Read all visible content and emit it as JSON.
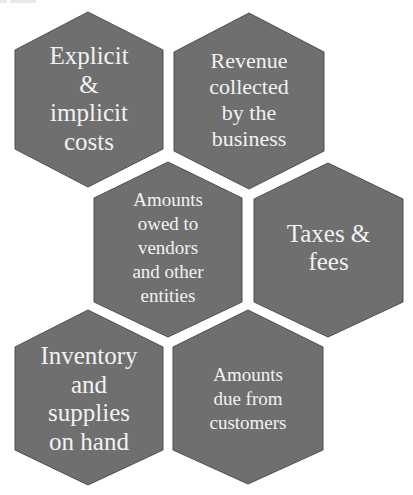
{
  "diagram": {
    "type": "hexagon-cluster",
    "fill_color": "#6f6f6f",
    "stroke_color": "#4e4e4e",
    "text_color": "#f2f2f2",
    "background": "#ffffff",
    "hexagons": [
      {
        "id": "explicit-implicit-costs",
        "lines": [
          "Explicit",
          "&",
          "implicit",
          "costs"
        ]
      },
      {
        "id": "revenue-collected",
        "lines": [
          "Revenue",
          "collected",
          "by the",
          "business"
        ]
      },
      {
        "id": "amounts-owed",
        "lines": [
          "Amounts",
          "owed to",
          "vendors",
          "and other",
          "entities"
        ]
      },
      {
        "id": "taxes-fees",
        "lines": [
          "Taxes &",
          "fees"
        ]
      },
      {
        "id": "inventory-supplies",
        "lines": [
          "Inventory",
          "and",
          "supplies",
          "on hand"
        ]
      },
      {
        "id": "amounts-due",
        "lines": [
          "Amounts",
          "due from",
          "customers"
        ]
      }
    ]
  }
}
